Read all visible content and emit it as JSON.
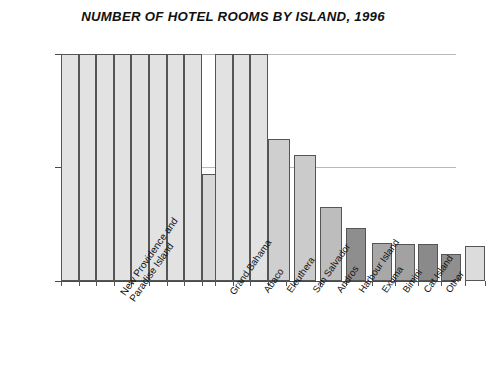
{
  "chart": {
    "title": "NUMBER OF HOTEL ROOMS BY ISLAND, 1996",
    "y_ticks": [
      "1000",
      "500",
      "0"
    ]
  },
  "chart_data": {
    "type": "bar",
    "title": "NUMBER OF HOTEL ROOMS BY ISLAND, 1996",
    "xlabel": "",
    "ylabel": "",
    "ylim": [
      0,
      1000
    ],
    "yticks": [
      0,
      500,
      1000
    ],
    "grid": true,
    "legend": false,
    "note": "The first two categories are drawn as grouped clusters of sub-bars clipped at the top of the 1000 axis; their totals exceed the plotted range.",
    "categories": [
      "New Providence and Paradise Island",
      "Grand Bahama",
      "Abaco",
      "Eleuthera",
      "San Salvador",
      "Andros",
      "Harbour Island",
      "Exuma",
      "Bimini",
      "Cat Island",
      "Other"
    ],
    "values": [
      1000,
      1000,
      627,
      557,
      325,
      235,
      167,
      165,
      162,
      118,
      154
    ],
    "clipped": [
      true,
      true,
      false,
      false,
      false,
      false,
      false,
      false,
      false,
      false,
      false
    ],
    "bar_colors": [
      "#e2e2e2",
      "#e2e2e2",
      "#cfcfcf",
      "#cbcbcb",
      "#bdbdbd",
      "#8e8e8e",
      "#a8a8a8",
      "#a2a2a2",
      "#8a8a8a",
      "#8f8f8f",
      "#dcdcdc"
    ],
    "secondary_bars": [
      {
        "category": "New Providence and Paradise Island",
        "value": 472,
        "color": "#d8d8d8"
      },
      {
        "category": "Grand Bahama",
        "value": 370,
        "color": "#dcdcdc"
      }
    ]
  }
}
